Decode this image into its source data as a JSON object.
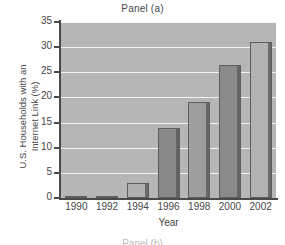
{
  "chart_data": {
    "type": "bar",
    "title": "Panel (a)",
    "xlabel": "Year",
    "ylabel_lines": [
      "U.S. Households with an",
      "Internet Link (%)"
    ],
    "ylabel": "U.S. Households with an Internet Link (%)",
    "categories": [
      "1990",
      "1992",
      "1994",
      "1996",
      "1998",
      "2000",
      "2002"
    ],
    "values": [
      0.3,
      0.3,
      3,
      14,
      19,
      26.5,
      31
    ],
    "ylim": [
      0,
      35
    ],
    "yticks": [
      0,
      5,
      10,
      15,
      20,
      25,
      30,
      35
    ],
    "ytick_labels": [
      "0",
      "5",
      "10",
      "15",
      "20",
      "25",
      "30",
      "35"
    ],
    "grid": true,
    "legend": "none",
    "bar_colors": [
      "#8f8f8f",
      "#8f8f8f",
      "#b0b0b0",
      "#888888",
      "#9e9e9e",
      "#8a8a8a",
      "#b2b2b2"
    ],
    "plot_background": "#b6b6b6",
    "gridline_color": "#f2f2f2",
    "axis_color": "#4a4a4a"
  },
  "figure": {
    "next_panel_caption": "Panel (b)"
  }
}
